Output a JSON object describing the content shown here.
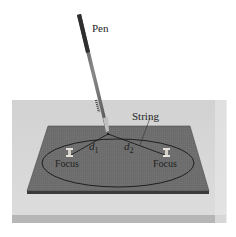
{
  "labels": {
    "pen": "Pen",
    "string": "String",
    "d1": "d",
    "d1_sub": "1",
    "d2": "d",
    "d2_sub": "2",
    "focus_left": "Focus",
    "focus_right": "Focus"
  },
  "colors": {
    "table": "#cfcfcf",
    "table_edge": "#b3b3b3",
    "board": "#6e6e6e",
    "board_edge": "#3a3a3a",
    "ellipse": "#1e1e1e",
    "pen": "#555555",
    "pin": "#e0dcd4"
  }
}
